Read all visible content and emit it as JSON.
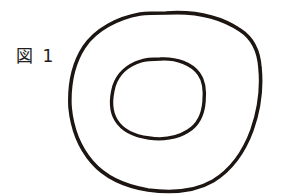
{
  "figure": {
    "caption": "図 1",
    "caption_label": "図",
    "caption_number": "1",
    "background_color": "#ffffff",
    "ink_color": "#1c1512",
    "media": "hand-drawn line art, scanned"
  },
  "chart_data": {
    "type": "diagram",
    "title": "図 1",
    "shapes": [
      {
        "name": "outer-blob",
        "kind": "closed-freehand-curve",
        "stroke_color": "#1c1512",
        "stroke_width": 3.6,
        "bbox": {
          "x": 70,
          "y": 12,
          "width": 192,
          "height": 179
        },
        "center": {
          "x": 166,
          "y": 101
        },
        "path": "M 166 13 C 196 11 222 18 240 30 C 254 39 259 52 260 68 C 262 88 259 110 252 130 C 244 152 231 170 213 181 C 194 192 170 193 148 190 C 124 186 104 176 92 162 C 79 147 72 128 70 107 C 69 86 73 64 84 47 C 96 29 118 18 140 14 C 148 13 157 13 166 13 Z"
      },
      {
        "name": "inner-circle",
        "kind": "closed-freehand-curve",
        "stroke_color": "#1c1512",
        "stroke_width": 3.4,
        "bbox": {
          "x": 112,
          "y": 58,
          "width": 94,
          "height": 82
        },
        "center": {
          "x": 159,
          "y": 99
        },
        "path": "M 160 59 C 177 58 192 64 199 74 C 205 82 205 92 204 102 C 203 114 198 125 188 131 C 177 138 162 140 149 138 C 134 136 122 130 116 120 C 110 110 111 97 114 86 C 118 74 128 65 141 61 C 147 59 153 59 160 59 Z"
      }
    ],
    "labels": [
      {
        "name": "figure-caption",
        "text": "図 1",
        "position": {
          "x": 16,
          "y": 46
        },
        "font_size": 17,
        "color": "#231c18"
      }
    ],
    "xlabel": "",
    "ylabel": "",
    "grid": false,
    "legend": false
  }
}
